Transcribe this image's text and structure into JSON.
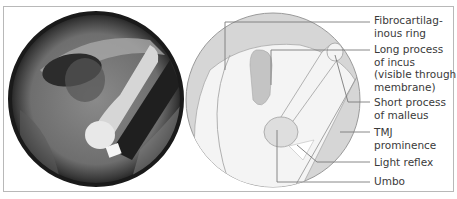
{
  "figure": {
    "photo": {
      "alt": "Otoscopic photograph of tympanic membrane"
    },
    "diagram": {
      "labels": [
        {
          "id": "fibrocartilaginous-ring",
          "text": "Fibrocartilag-\ninous ring"
        },
        {
          "id": "long-process-incus",
          "text": "Long process\nof incus\n(visible through\nmembrane)"
        },
        {
          "id": "short-process-malleus",
          "text": "Short process\nof malleus"
        },
        {
          "id": "tmj-prominence",
          "text": "TMJ\nprominence"
        },
        {
          "id": "light-reflex",
          "text": "Light reflex"
        },
        {
          "id": "umbo",
          "text": "Umbo"
        }
      ]
    },
    "colors": {
      "frame": "#b8b8b8",
      "diagram_fill": "#f2f2f2",
      "shaded": "#d4d4d4",
      "outline": "#9a9a9a",
      "leader": "#7a7a7a",
      "text": "#3a3a3a"
    }
  }
}
